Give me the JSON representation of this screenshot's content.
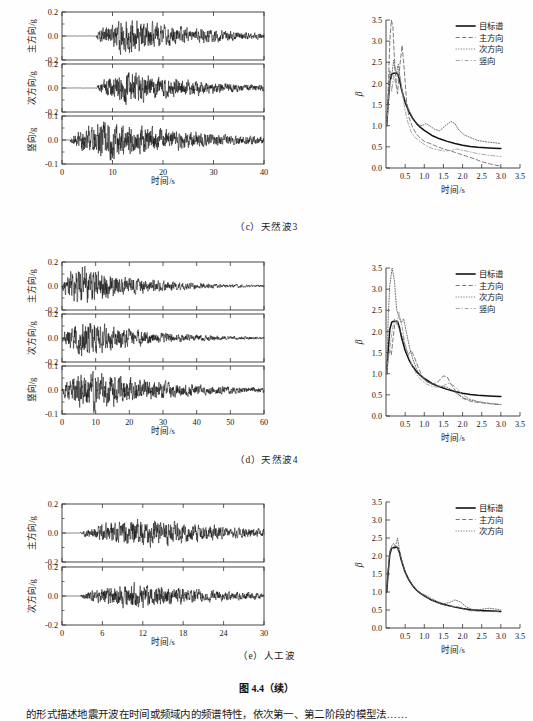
{
  "figure": {
    "title": "图 4.4（续）",
    "body_text": "的形式描述地震开波在时间或频域内的频谱特性，依次第一、第二阶段的模型法……"
  },
  "panels": [
    {
      "id": "c",
      "caption": "（c）天然波3",
      "accel": {
        "xlabel": "时间/s",
        "xticks": [
          "0",
          "10",
          "20",
          "30",
          "40"
        ],
        "xmin": 0,
        "xmax": 40,
        "traces": [
          {
            "name": "主方向",
            "ylabel": "主方向/g",
            "yticks": [
              "0.2",
              "0.0",
              "-0.2"
            ],
            "ymin": -0.2,
            "ymax": 0.2,
            "onset": 0.17,
            "peak_time": 0.31,
            "amp": 0.155,
            "decay": 2.6,
            "seed": 11
          },
          {
            "name": "次方向",
            "ylabel": "次方向/g",
            "yticks": [
              "0.2",
              "0.0",
              "-0.2"
            ],
            "ymin": -0.2,
            "ymax": 0.2,
            "onset": 0.17,
            "peak_time": 0.33,
            "amp": 0.14,
            "decay": 2.6,
            "seed": 23
          },
          {
            "name": "竖向",
            "ylabel": "竖向/g",
            "yticks": [
              "0.1",
              "0.0",
              "-0.1"
            ],
            "ymin": -0.1,
            "ymax": 0.1,
            "onset": 0.04,
            "peak_time": 0.22,
            "amp": 0.085,
            "decay": 2.2,
            "seed": 37
          }
        ]
      },
      "chart_data": {
        "type": "line",
        "title": "",
        "xlabel": "时间/s",
        "ylabel": "β",
        "xlim": [
          0,
          3.5
        ],
        "ylim": [
          0,
          3.5
        ],
        "xticks": [
          "0.5",
          "1.0",
          "1.5",
          "2.0",
          "2.5",
          "3.0",
          "3.5"
        ],
        "yticks": [
          "0.0",
          "0.5",
          "1.0",
          "1.5",
          "2.0",
          "2.5",
          "3.0",
          "3.5"
        ],
        "grid": false,
        "legend_position": "top-right",
        "series": [
          {
            "name": "目标谱",
            "style": "solid",
            "x": [
              0.02,
              0.05,
              0.1,
              0.15,
              0.2,
              0.25,
              0.3,
              0.35,
              0.4,
              0.5,
              0.6,
              0.7,
              0.8,
              0.9,
              1.0,
              1.2,
              1.4,
              1.6,
              1.8,
              2.0,
              2.2,
              2.4,
              2.6,
              2.8,
              3.0
            ],
            "y": [
              1.0,
              1.45,
              2.05,
              2.22,
              2.24,
              2.24,
              2.24,
              2.1,
              1.88,
              1.55,
              1.33,
              1.17,
              1.05,
              0.96,
              0.89,
              0.77,
              0.69,
              0.63,
              0.58,
              0.54,
              0.51,
              0.49,
              0.48,
              0.47,
              0.46
            ]
          },
          {
            "name": "主方向",
            "style": "dashed",
            "x": [
              0.02,
              0.06,
              0.1,
              0.14,
              0.18,
              0.22,
              0.26,
              0.3,
              0.36,
              0.42,
              0.48,
              0.54,
              0.6,
              0.7,
              0.8,
              0.9,
              1.0,
              1.15,
              1.3,
              1.5,
              1.7,
              1.9,
              2.1,
              2.3,
              2.5,
              2.7,
              2.9,
              3.0
            ],
            "y": [
              1.05,
              1.9,
              3.0,
              3.5,
              3.35,
              2.6,
              2.05,
              1.75,
              2.4,
              2.9,
              2.3,
              1.55,
              1.2,
              0.95,
              0.8,
              0.7,
              0.63,
              0.58,
              0.52,
              0.45,
              0.4,
              0.34,
              0.28,
              0.22,
              0.15,
              0.1,
              0.06,
              0.05
            ]
          },
          {
            "name": "次方向",
            "style": "dotted",
            "x": [
              0.02,
              0.06,
              0.1,
              0.14,
              0.2,
              0.26,
              0.32,
              0.38,
              0.44,
              0.5,
              0.58,
              0.66,
              0.74,
              0.84,
              0.94,
              1.04,
              1.14,
              1.26,
              1.4,
              1.55,
              1.7,
              1.8,
              1.9,
              2.05,
              2.2,
              2.4,
              2.6,
              2.8,
              3.0
            ],
            "y": [
              1.1,
              1.7,
              2.3,
              2.1,
              2.55,
              2.2,
              2.45,
              2.05,
              1.75,
              1.6,
              1.42,
              1.25,
              1.12,
              1.02,
              1.0,
              1.05,
              1.0,
              0.92,
              0.88,
              1.0,
              1.1,
              1.05,
              0.9,
              0.78,
              0.72,
              0.65,
              0.62,
              0.6,
              0.58
            ]
          },
          {
            "name": "竖向",
            "style": "dashdot",
            "x": [
              0.02,
              0.06,
              0.1,
              0.15,
              0.2,
              0.26,
              0.32,
              0.38,
              0.44,
              0.5,
              0.58,
              0.66,
              0.76,
              0.86,
              0.96,
              1.1,
              1.25,
              1.4,
              1.55,
              1.7,
              1.85,
              2.0,
              2.2,
              2.4,
              2.6,
              2.8,
              3.0
            ],
            "y": [
              1.0,
              1.6,
              2.1,
              1.8,
              2.2,
              1.95,
              2.3,
              2.1,
              1.7,
              1.35,
              1.05,
              0.85,
              0.72,
              0.65,
              0.58,
              0.5,
              0.45,
              0.42,
              0.4,
              0.42,
              0.45,
              0.42,
              0.38,
              0.34,
              0.31,
              0.29,
              0.27
            ]
          }
        ]
      }
    },
    {
      "id": "d",
      "caption": "（d）天然波4",
      "accel": {
        "xlabel": "时间/s",
        "xticks": [
          "0",
          "10",
          "20",
          "30",
          "40",
          "50",
          "60"
        ],
        "xmin": 0,
        "xmax": 60,
        "traces": [
          {
            "name": "主方向",
            "ylabel": "主方向/g",
            "yticks": [
              "0.2",
              "0.0",
              "-0.2"
            ],
            "ymin": -0.2,
            "ymax": 0.2,
            "onset": 0.0,
            "peak_time": 0.07,
            "amp": 0.165,
            "decay": 3.2,
            "seed": 53
          },
          {
            "name": "次方向",
            "ylabel": "次方向/g",
            "yticks": [
              "0.2",
              "0.0",
              "-0.2"
            ],
            "ymin": -0.2,
            "ymax": 0.2,
            "onset": 0.0,
            "peak_time": 0.1,
            "amp": 0.15,
            "decay": 3.0,
            "seed": 67
          },
          {
            "name": "竖向",
            "ylabel": "竖向/g",
            "yticks": [
              "0.1",
              "0.0",
              "-0.1"
            ],
            "ymin": -0.1,
            "ymax": 0.1,
            "onset": 0.0,
            "peak_time": 0.12,
            "amp": 0.095,
            "decay": 2.4,
            "seed": 83
          }
        ]
      },
      "chart_data": {
        "type": "line",
        "title": "",
        "xlabel": "时间/s",
        "ylabel": "β",
        "xlim": [
          0,
          3.5
        ],
        "ylim": [
          0,
          3.5
        ],
        "xticks": [
          "0.5",
          "1.0",
          "1.5",
          "2.0",
          "2.5",
          "3.0",
          "3.5"
        ],
        "yticks": [
          "0.0",
          "0.5",
          "1.0",
          "1.5",
          "2.0",
          "2.5",
          "3.0",
          "3.5"
        ],
        "grid": false,
        "legend_position": "top-right",
        "series": [
          {
            "name": "目标谱",
            "style": "solid",
            "x": [
              0.02,
              0.05,
              0.1,
              0.15,
              0.2,
              0.25,
              0.3,
              0.35,
              0.4,
              0.5,
              0.6,
              0.7,
              0.8,
              0.9,
              1.0,
              1.2,
              1.4,
              1.6,
              1.8,
              2.0,
              2.2,
              2.4,
              2.6,
              2.8,
              3.0
            ],
            "y": [
              1.0,
              1.45,
              2.05,
              2.22,
              2.24,
              2.24,
              2.24,
              2.1,
              1.88,
              1.55,
              1.33,
              1.17,
              1.05,
              0.96,
              0.89,
              0.77,
              0.69,
              0.63,
              0.58,
              0.54,
              0.51,
              0.49,
              0.48,
              0.47,
              0.46
            ]
          },
          {
            "name": "主方向",
            "style": "dashed",
            "x": [
              0.02,
              0.06,
              0.1,
              0.14,
              0.18,
              0.24,
              0.3,
              0.36,
              0.42,
              0.5,
              0.58,
              0.66,
              0.74,
              0.84,
              0.94,
              1.05,
              1.2,
              1.35,
              1.5,
              1.6,
              1.7,
              1.85,
              2.0,
              2.2,
              2.4,
              2.6,
              2.8,
              3.0
            ],
            "y": [
              1.05,
              1.5,
              1.55,
              1.45,
              1.8,
              2.25,
              2.2,
              2.0,
              1.95,
              1.65,
              1.45,
              1.55,
              1.4,
              1.15,
              0.95,
              0.82,
              0.75,
              0.8,
              0.95,
              0.92,
              0.75,
              0.55,
              0.42,
              0.35,
              0.32,
              0.3,
              0.28,
              0.27
            ]
          },
          {
            "name": "次方向",
            "style": "dotted",
            "x": [
              0.02,
              0.06,
              0.1,
              0.16,
              0.22,
              0.28,
              0.34,
              0.4,
              0.46,
              0.54,
              0.62,
              0.7,
              0.8,
              0.9,
              1.0,
              1.15,
              1.3,
              1.45,
              1.6,
              1.75,
              1.9,
              2.05,
              2.2,
              2.4,
              2.6,
              2.8,
              3.0
            ],
            "y": [
              1.1,
              2.4,
              3.1,
              3.5,
              3.2,
              2.5,
              2.35,
              2.2,
              2.3,
              1.95,
              1.6,
              1.35,
              1.1,
              0.95,
              0.85,
              0.78,
              0.72,
              0.7,
              0.68,
              0.6,
              0.5,
              0.42,
              0.38,
              0.34,
              0.31,
              0.29,
              0.27
            ]
          },
          {
            "name": "竖向",
            "style": "dashdot",
            "x": [
              0.02,
              0.06,
              0.1,
              0.16,
              0.22,
              0.28,
              0.34,
              0.42,
              0.5,
              0.6,
              0.7,
              0.8,
              0.92,
              1.05,
              1.2,
              1.35,
              1.5,
              1.65,
              1.8,
              2.0,
              2.2,
              2.4,
              2.6,
              2.8,
              3.0
            ],
            "y": [
              1.0,
              1.35,
              1.6,
              2.0,
              2.3,
              2.15,
              2.45,
              2.1,
              1.7,
              1.4,
              1.15,
              0.98,
              0.85,
              0.76,
              0.7,
              0.68,
              0.72,
              0.78,
              0.7,
              0.5,
              0.4,
              0.34,
              0.31,
              0.29,
              0.27
            ]
          }
        ]
      }
    },
    {
      "id": "e",
      "caption": "（e）人工波",
      "accel": {
        "xlabel": "时间/s",
        "xticks": [
          "0",
          "6",
          "12",
          "18",
          "24",
          "30"
        ],
        "xmin": 0,
        "xmax": 30,
        "traces": [
          {
            "name": "主方向",
            "ylabel": "主方向/g",
            "yticks": [
              "0.2",
              "0.0",
              "-0.2"
            ],
            "ymin": -0.2,
            "ymax": 0.2,
            "onset": 0.09,
            "peak_time": 0.4,
            "amp": 0.1,
            "decay": 2.1,
            "seed": 101
          },
          {
            "name": "次方向",
            "ylabel": "次方向/g",
            "yticks": [
              "0.2",
              "0.0",
              "-0.2"
            ],
            "ymin": -0.2,
            "ymax": 0.2,
            "onset": 0.09,
            "peak_time": 0.36,
            "amp": 0.095,
            "decay": 2.1,
            "seed": 127
          }
        ]
      },
      "chart_data": {
        "type": "line",
        "title": "",
        "xlabel": "时间/s",
        "ylabel": "β",
        "xlim": [
          0,
          3.5
        ],
        "ylim": [
          0,
          3.5
        ],
        "xticks": [
          "0.5",
          "1.0",
          "1.5",
          "2.0",
          "2.5",
          "3.0",
          "3.5"
        ],
        "yticks": [
          "0.0",
          "0.5",
          "1.0",
          "1.5",
          "2.0",
          "2.5",
          "3.0",
          "3.5"
        ],
        "grid": false,
        "legend_position": "top-right",
        "series": [
          {
            "name": "目标谱",
            "style": "solid",
            "x": [
              0.02,
              0.05,
              0.1,
              0.15,
              0.2,
              0.25,
              0.3,
              0.35,
              0.4,
              0.5,
              0.6,
              0.7,
              0.8,
              0.9,
              1.0,
              1.2,
              1.4,
              1.6,
              1.8,
              2.0,
              2.2,
              2.4,
              2.6,
              2.8,
              3.0
            ],
            "y": [
              1.0,
              1.45,
              2.05,
              2.22,
              2.24,
              2.24,
              2.24,
              2.1,
              1.88,
              1.55,
              1.33,
              1.17,
              1.05,
              0.96,
              0.89,
              0.77,
              0.69,
              0.63,
              0.58,
              0.54,
              0.51,
              0.49,
              0.48,
              0.47,
              0.46
            ]
          },
          {
            "name": "主方向",
            "style": "dashed",
            "x": [
              0.02,
              0.05,
              0.1,
              0.15,
              0.2,
              0.25,
              0.3,
              0.35,
              0.4,
              0.5,
              0.6,
              0.7,
              0.8,
              0.9,
              1.0,
              1.15,
              1.3,
              1.45,
              1.6,
              1.75,
              1.9,
              2.05,
              2.2,
              2.4,
              2.6,
              2.8,
              3.0
            ],
            "y": [
              1.02,
              1.5,
              2.1,
              2.25,
              2.2,
              2.22,
              2.25,
              2.12,
              1.9,
              1.57,
              1.35,
              1.18,
              1.06,
              0.97,
              0.9,
              0.8,
              0.72,
              0.66,
              0.62,
              0.6,
              0.58,
              0.52,
              0.48,
              0.47,
              0.46,
              0.46,
              0.45
            ]
          },
          {
            "name": "次方向",
            "style": "dotted",
            "x": [
              0.02,
              0.05,
              0.1,
              0.15,
              0.2,
              0.25,
              0.3,
              0.35,
              0.42,
              0.52,
              0.62,
              0.72,
              0.82,
              0.92,
              1.02,
              1.18,
              1.34,
              1.5,
              1.65,
              1.8,
              1.95,
              2.1,
              2.3,
              2.5,
              2.7,
              2.9,
              3.0
            ],
            "y": [
              1.05,
              1.55,
              2.15,
              2.28,
              2.35,
              2.26,
              2.5,
              2.18,
              1.85,
              1.52,
              1.32,
              1.16,
              1.04,
              0.95,
              0.92,
              0.82,
              0.74,
              0.68,
              0.7,
              0.78,
              0.72,
              0.58,
              0.5,
              0.52,
              0.55,
              0.52,
              0.5
            ]
          }
        ]
      }
    }
  ]
}
